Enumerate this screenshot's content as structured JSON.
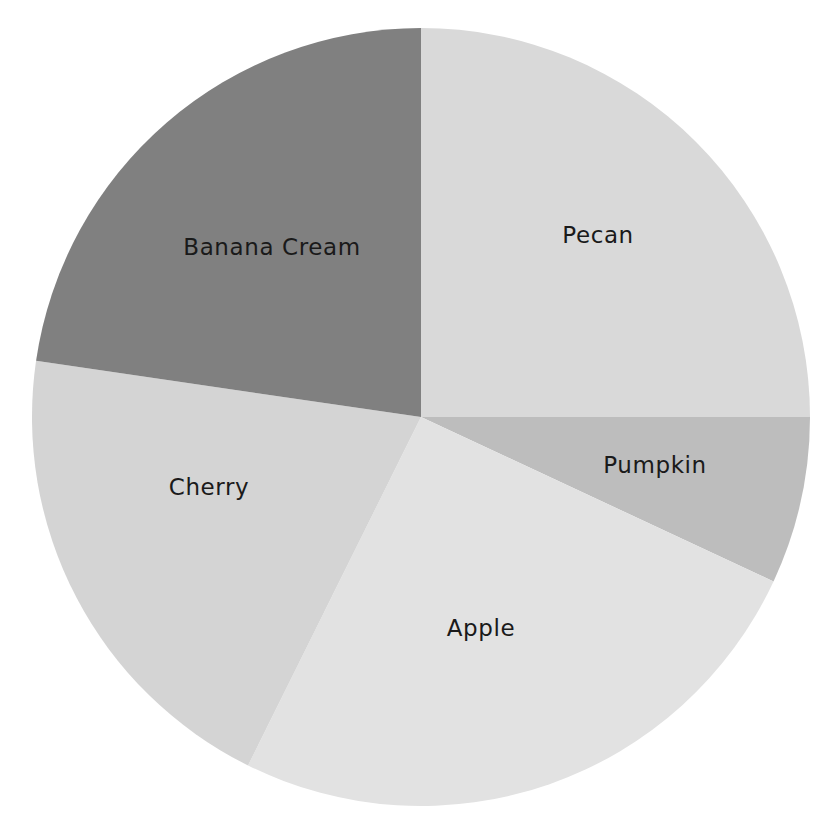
{
  "chart_data": {
    "type": "pie",
    "title": "",
    "subtitle": "",
    "xlabel": "",
    "ylabel": "",
    "legend_position": "none",
    "labels_inside": true,
    "start_angle_deg": 90,
    "direction": "clockwise",
    "categories": [
      "Pecan",
      "Pumpkin",
      "Apple",
      "Cherry",
      "Banana Cream"
    ],
    "values": [
      25.0,
      7.0,
      25.4,
      20.0,
      22.6
    ],
    "angles_deg": [
      90.0,
      25.0,
      91.4,
      71.9,
      81.7
    ],
    "colors": [
      "#d9d9d9",
      "#bdbdbd",
      "#e2e2e2",
      "#d4d4d4",
      "#808080"
    ],
    "slices": [
      {
        "label": "Pecan",
        "value": 25.0,
        "angle_deg": 90.0,
        "color": "#d9d9d9",
        "label_x": 598,
        "label_y": 236
      },
      {
        "label": "Pumpkin",
        "value": 7.0,
        "angle_deg": 25.0,
        "color": "#bdbdbd",
        "label_x": 655,
        "label_y": 466
      },
      {
        "label": "Apple",
        "value": 25.4,
        "angle_deg": 91.4,
        "color": "#e2e2e2",
        "label_x": 481,
        "label_y": 629
      },
      {
        "label": "Cherry",
        "value": 20.0,
        "angle_deg": 71.9,
        "color": "#d4d4d4",
        "label_x": 209,
        "label_y": 488
      },
      {
        "label": "Banana Cream",
        "value": 22.6,
        "angle_deg": 81.7,
        "color": "#808080",
        "label_x": 272,
        "label_y": 248
      }
    ],
    "geometry": {
      "center_x": 421,
      "center_y": 417,
      "radius": 389
    },
    "background_color": "#ffffff"
  }
}
